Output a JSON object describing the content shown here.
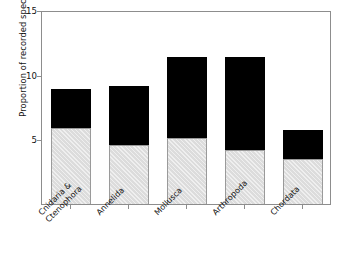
{
  "chart_data": {
    "type": "bar",
    "stacked": true,
    "title": "",
    "xlabel": "",
    "ylabel": "Proportion of recorded species",
    "categories": [
      "Cnidaria &\nCtenophora",
      "Annelida",
      "Mollusca",
      "Arthropoda",
      "Chordata"
    ],
    "category_labels_flat": [
      "Cnidaria & Ctenophora",
      "Annelida",
      "Mollusca",
      "Arthropoda",
      "Chordata"
    ],
    "series": [
      {
        "name": "lower-segment",
        "color": "#dcdcdc",
        "values": [
          5.9,
          4.6,
          5.1,
          4.2,
          3.5
        ]
      },
      {
        "name": "upper-segment",
        "color": "#000000",
        "values": [
          3.0,
          4.5,
          6.3,
          7.2,
          2.2
        ]
      }
    ],
    "totals": [
      8.9,
      9.1,
      11.4,
      11.4,
      5.7
    ],
    "ylim": [
      0,
      15
    ],
    "yticks": [
      5,
      10,
      15
    ],
    "ytick_labels": [
      "5",
      "10",
      "15"
    ],
    "grid": false,
    "legend": "none",
    "frame_color": "#8d8d8d",
    "background": "#ffffff"
  }
}
